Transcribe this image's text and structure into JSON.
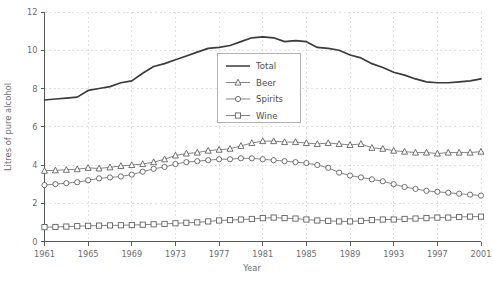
{
  "chart_data": {
    "type": "line",
    "title": "",
    "xlabel": "Year",
    "ylabel": "Litres of pure alcohol",
    "xlim": [
      1961,
      2001
    ],
    "ylim": [
      0,
      12
    ],
    "xticks": [
      1961,
      1965,
      1969,
      1973,
      1977,
      1981,
      1985,
      1989,
      1993,
      1997,
      2001
    ],
    "yticks": [
      0,
      2,
      4,
      6,
      8,
      10,
      12
    ],
    "grid": "dashed-both",
    "legend_position": "upper-center",
    "x": [
      1961,
      1962,
      1963,
      1964,
      1965,
      1966,
      1967,
      1968,
      1969,
      1970,
      1971,
      1972,
      1973,
      1974,
      1975,
      1976,
      1977,
      1978,
      1979,
      1980,
      1981,
      1982,
      1983,
      1984,
      1985,
      1986,
      1987,
      1988,
      1989,
      1990,
      1991,
      1992,
      1993,
      1994,
      1995,
      1996,
      1997,
      1998,
      1999,
      2000,
      2001
    ],
    "series": [
      {
        "name": "Total",
        "marker": "none",
        "values": [
          7.4,
          7.45,
          7.5,
          7.55,
          7.9,
          8.0,
          8.1,
          8.3,
          8.4,
          8.8,
          9.15,
          9.3,
          9.5,
          9.7,
          9.9,
          10.1,
          10.15,
          10.25,
          10.45,
          10.65,
          10.7,
          10.65,
          10.45,
          10.5,
          10.45,
          10.15,
          10.1,
          10.0,
          9.75,
          9.6,
          9.3,
          9.1,
          8.85,
          8.7,
          8.5,
          8.35,
          8.3,
          8.3,
          8.35,
          8.4,
          8.5
        ]
      },
      {
        "name": "Beer",
        "marker": "triangle",
        "values": [
          3.7,
          3.72,
          3.75,
          3.78,
          3.85,
          3.82,
          3.88,
          3.95,
          4.0,
          4.05,
          4.15,
          4.3,
          4.5,
          4.6,
          4.65,
          4.75,
          4.8,
          4.85,
          5.0,
          5.15,
          5.25,
          5.25,
          5.2,
          5.2,
          5.15,
          5.1,
          5.15,
          5.1,
          5.05,
          5.1,
          4.9,
          4.85,
          4.75,
          4.7,
          4.65,
          4.65,
          4.6,
          4.65,
          4.65,
          4.65,
          4.7
        ]
      },
      {
        "name": "Spirits",
        "marker": "circle",
        "values": [
          2.95,
          3.0,
          3.05,
          3.1,
          3.2,
          3.3,
          3.35,
          3.4,
          3.5,
          3.65,
          3.8,
          3.9,
          4.05,
          4.15,
          4.2,
          4.25,
          4.3,
          4.3,
          4.35,
          4.35,
          4.3,
          4.25,
          4.2,
          4.15,
          4.1,
          4.0,
          3.85,
          3.6,
          3.45,
          3.35,
          3.25,
          3.15,
          3.0,
          2.85,
          2.75,
          2.65,
          2.6,
          2.55,
          2.5,
          2.45,
          2.4
        ]
      },
      {
        "name": "Wine",
        "marker": "square",
        "values": [
          0.75,
          0.76,
          0.78,
          0.8,
          0.82,
          0.83,
          0.84,
          0.85,
          0.86,
          0.88,
          0.9,
          0.92,
          0.95,
          0.98,
          1.0,
          1.05,
          1.1,
          1.12,
          1.15,
          1.18,
          1.22,
          1.25,
          1.22,
          1.2,
          1.15,
          1.1,
          1.08,
          1.05,
          1.05,
          1.08,
          1.12,
          1.15,
          1.15,
          1.18,
          1.2,
          1.22,
          1.25,
          1.25,
          1.28,
          1.3,
          1.3
        ]
      }
    ],
    "colors": {
      "total_line": "#3b3b3d",
      "series_line": "#6d6e71",
      "marker_fill": "#ffffff",
      "marker_stroke": "#58595b",
      "gridline": "#d9d9d9",
      "axis": "#58595b",
      "text": "#6d6e71",
      "legend_border": "#a7a9ac"
    }
  },
  "legend": {
    "entries": [
      {
        "label": "Total"
      },
      {
        "label": "Beer"
      },
      {
        "label": "Spirits"
      },
      {
        "label": "Wine"
      }
    ]
  }
}
